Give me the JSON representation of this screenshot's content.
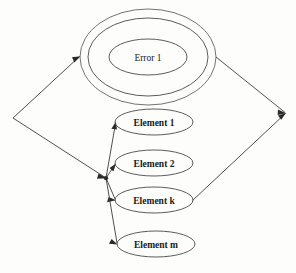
{
  "diagram": {
    "type": "flow-diagram",
    "canvas": {
      "width": 296,
      "height": 273,
      "background": "#fdfdfc"
    },
    "stroke_color": "#3c3c3c",
    "text_color": "#1a1a1a",
    "error_group": {
      "name": "error-group",
      "label": "Error 1",
      "ring_count": 3,
      "center": {
        "x": 148,
        "y": 57
      },
      "rings": [
        {
          "rx": 68,
          "ry": 48
        },
        {
          "rx": 60,
          "ry": 39
        },
        {
          "rx": 39,
          "ry": 18
        }
      ]
    },
    "elements": [
      {
        "name": "element-1",
        "label": "Element 1",
        "cx": 154,
        "cy": 122,
        "rx": 39,
        "ry": 13
      },
      {
        "name": "element-2",
        "label": "Element 2",
        "cx": 154,
        "cy": 163,
        "rx": 39,
        "ry": 13
      },
      {
        "name": "element-k",
        "label": "Element k",
        "cx": 154,
        "cy": 200,
        "rx": 39,
        "ry": 13
      },
      {
        "name": "element-m",
        "label": "Element m",
        "cx": 156,
        "cy": 244,
        "rx": 39,
        "ry": 13
      }
    ],
    "vertices": {
      "left": {
        "name": "left-vertex",
        "x": 13,
        "y": 118
      },
      "right": {
        "name": "right-vertex",
        "x": 286,
        "y": 113
      },
      "junction": {
        "name": "branch-junction",
        "x": 106,
        "y": 178
      }
    },
    "edges": [
      {
        "name": "edge-left-to-error",
        "from": "left-vertex",
        "to": "error-group",
        "arrow": "target"
      },
      {
        "name": "edge-error-to-right",
        "from": "error-group",
        "to": "right-vertex",
        "arrow": "target"
      },
      {
        "name": "edge-left-to-junction",
        "from": "left-vertex",
        "to": "branch-junction",
        "arrow": "target"
      },
      {
        "name": "edge-junction-to-element-1",
        "from": "branch-junction",
        "to": "element-1",
        "arrow": "target"
      },
      {
        "name": "edge-junction-to-element-2",
        "from": "branch-junction",
        "to": "element-2",
        "arrow": "target"
      },
      {
        "name": "edge-junction-to-element-k",
        "from": "branch-junction",
        "to": "element-k",
        "arrow": "target"
      },
      {
        "name": "edge-junction-to-element-m",
        "from": "branch-junction",
        "to": "element-m",
        "arrow": "target"
      },
      {
        "name": "edge-element-k-to-right",
        "from": "element-k",
        "to": "right-vertex",
        "arrow": "target"
      }
    ]
  }
}
